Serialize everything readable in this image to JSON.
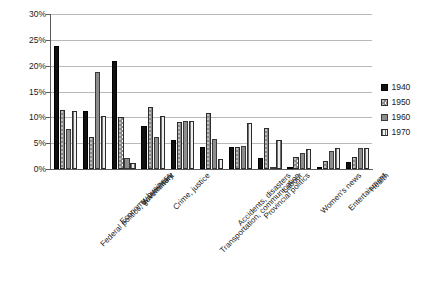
{
  "chart_data": {
    "type": "bar",
    "title": "",
    "subtitle": "",
    "xlabel": "",
    "ylabel": "",
    "ylim": [
      0,
      30
    ],
    "ytick_labels": [
      "30%",
      "25%",
      "20%",
      "15%",
      "10%",
      "5%",
      "0%"
    ],
    "ytick_values": [
      30,
      25,
      20,
      15,
      10,
      5,
      0
    ],
    "grid": true,
    "legend_position": "right",
    "categories": [
      "Federal politics, government",
      "Economy, business",
      "War/military",
      "Crime, justice",
      "Transportation, communication",
      "Accidents, disasters",
      "Provincial politics",
      "Labour",
      "Women's news",
      "Entertainment",
      "Health"
    ],
    "series": [
      {
        "name": "1940",
        "color": "#111111",
        "pattern": "solid-black",
        "values": [
          23.9,
          11.2,
          21.0,
          8.4,
          5.6,
          4.2,
          4.3,
          2.2,
          0.3,
          0.2,
          1.3
        ]
      },
      {
        "name": "1950",
        "color": "#8a8a8a",
        "pattern": "dotted-gray",
        "values": [
          11.5,
          6.1,
          10.0,
          12.0,
          9.1,
          10.8,
          4.3,
          8.0,
          2.3,
          1.5,
          2.3
        ]
      },
      {
        "name": "1960",
        "color": "#8d8d8d",
        "pattern": "solid-gray",
        "values": [
          7.8,
          18.8,
          2.2,
          6.1,
          9.2,
          5.9,
          4.4,
          0.2,
          3.1,
          3.5,
          4.0
        ]
      },
      {
        "name": "1970",
        "color": "#c9c9c9",
        "pattern": "vertical-stripes",
        "values": [
          11.3,
          10.3,
          1.2,
          10.2,
          9.2,
          2.0,
          9.0,
          5.7,
          3.8,
          4.0,
          4.0
        ]
      }
    ]
  },
  "legend": {
    "items": [
      {
        "label": "1940"
      },
      {
        "label": "1950"
      },
      {
        "label": "1960"
      },
      {
        "label": "1970"
      }
    ]
  }
}
